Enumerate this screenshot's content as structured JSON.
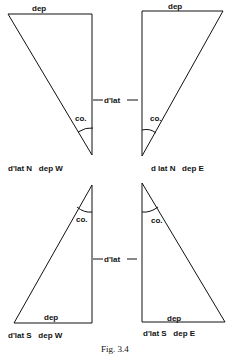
{
  "figure": {
    "caption": "Fig. 3.4",
    "center_labels": {
      "upper": "d'lat",
      "lower": "d'lat"
    },
    "triangles": [
      {
        "id": "top-left",
        "top_label": "dep",
        "angle_label": "co.",
        "caption": "d'lat N   dep W"
      },
      {
        "id": "top-right",
        "top_label": "dep",
        "angle_label": "co.",
        "caption": "d lat N   dep E"
      },
      {
        "id": "bottom-left",
        "bottom_label": "dep",
        "angle_label": "co.",
        "caption": "d'lat S   dep W"
      },
      {
        "id": "bottom-right",
        "bottom_label": "dep",
        "angle_label": "co.",
        "caption": "d'lat S   dep E"
      }
    ]
  }
}
